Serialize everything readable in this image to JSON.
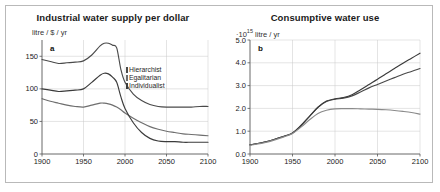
{
  "figure": {
    "panels": [
      "a",
      "b"
    ]
  },
  "panel_a": {
    "letter": "a",
    "title": "Industrial water supply per dollar",
    "unit_prefix": "litre / $ / yr",
    "legend": [
      {
        "label": "Hierarchist",
        "color": "#4a4a4a"
      },
      {
        "label": "Egalitarian",
        "color": "#6e6e6e"
      },
      {
        "label": "Individualist",
        "color": "#3b3b3b"
      }
    ]
  },
  "panel_b": {
    "letter": "b",
    "title": "Consumptive water use",
    "unit_main": "·10",
    "unit_exp": "15",
    "unit_tail": " litre / yr"
  },
  "chart_data": [
    {
      "type": "line",
      "title": "Industrial water supply per dollar",
      "panel": "a",
      "xlabel": "",
      "ylabel": "litre / $ / yr",
      "xlim": [
        1900,
        2100
      ],
      "ylim": [
        0,
        175
      ],
      "xticks": [
        1900,
        1950,
        2000,
        2050,
        2100
      ],
      "yticks": [
        0,
        50,
        100,
        150
      ],
      "grid": true,
      "legend_position": "upper-right",
      "series": [
        {
          "name": "Hierarchist",
          "color": "#4a4a4a",
          "x": [
            1900,
            1910,
            1920,
            1930,
            1940,
            1950,
            1960,
            1970,
            1975,
            1980,
            1985,
            1990,
            1995,
            2000,
            2010,
            2020,
            2030,
            2040,
            2050,
            2060,
            2070,
            2080,
            2090,
            2100
          ],
          "values": [
            145,
            142,
            139,
            140,
            141,
            143,
            152,
            166,
            170,
            170,
            167,
            163,
            130,
            110,
            92,
            82,
            76,
            73,
            72,
            72,
            72,
            72,
            73,
            73
          ]
        },
        {
          "name": "Egalitarian",
          "color": "#6e6e6e",
          "x": [
            1900,
            1910,
            1920,
            1930,
            1940,
            1950,
            1960,
            1970,
            1975,
            1980,
            1985,
            1990,
            1995,
            2000,
            2010,
            2020,
            2030,
            2040,
            2050,
            2060,
            2070,
            2080,
            2090,
            2100
          ],
          "values": [
            85,
            81,
            78,
            75,
            73,
            72,
            75,
            78,
            78,
            77,
            75,
            72,
            68,
            63,
            55,
            48,
            42,
            38,
            35,
            33,
            31,
            30,
            29,
            28
          ]
        },
        {
          "name": "Individualist",
          "color": "#3b3b3b",
          "x": [
            1900,
            1910,
            1920,
            1930,
            1940,
            1950,
            1960,
            1970,
            1975,
            1980,
            1985,
            1990,
            1995,
            2000,
            2010,
            2020,
            2030,
            2040,
            2050,
            2060,
            2070,
            2080,
            2090,
            2100
          ],
          "values": [
            100,
            98,
            96,
            97,
            98,
            100,
            110,
            121,
            124,
            123,
            118,
            110,
            88,
            70,
            48,
            33,
            24,
            20,
            19,
            19,
            18,
            18,
            18,
            18
          ]
        }
      ]
    },
    {
      "type": "line",
      "title": "Consumptive water use",
      "panel": "b",
      "xlabel": "",
      "ylabel": "·10^15 litre / yr",
      "xlim": [
        1900,
        2100
      ],
      "ylim": [
        0.0,
        5.0
      ],
      "xticks": [
        1900,
        1950,
        2000,
        2050,
        2100
      ],
      "yticks": [
        "0.0",
        "1.0",
        "2.0",
        "3.0",
        "4.0",
        "5.0"
      ],
      "grid": true,
      "legend_position": "none",
      "series": [
        {
          "name": "Hierarchist",
          "color": "#4a4a4a",
          "x": [
            1900,
            1920,
            1940,
            1950,
            1960,
            1970,
            1980,
            1990,
            2000,
            2010,
            2020,
            2030,
            2040,
            2050,
            2060,
            2070,
            2080,
            2090,
            2100
          ],
          "values": [
            0.4,
            0.55,
            0.78,
            0.92,
            1.25,
            1.65,
            2.05,
            2.3,
            2.4,
            2.45,
            2.55,
            2.72,
            2.9,
            3.05,
            3.2,
            3.35,
            3.5,
            3.62,
            3.75
          ]
        },
        {
          "name": "Individualist",
          "color": "#3b3b3b",
          "x": [
            1900,
            1920,
            1940,
            1950,
            1960,
            1970,
            1980,
            1990,
            2000,
            2010,
            2020,
            2030,
            2040,
            2050,
            2060,
            2070,
            2080,
            2090,
            2100
          ],
          "values": [
            0.4,
            0.55,
            0.78,
            0.92,
            1.25,
            1.65,
            2.05,
            2.32,
            2.42,
            2.48,
            2.6,
            2.82,
            3.05,
            3.28,
            3.52,
            3.75,
            3.98,
            4.2,
            4.42
          ]
        },
        {
          "name": "Egalitarian",
          "color": "#8a8a8a",
          "x": [
            1900,
            1920,
            1940,
            1950,
            1960,
            1970,
            1980,
            1990,
            2000,
            2010,
            2020,
            2030,
            2040,
            2050,
            2060,
            2070,
            2080,
            2090,
            2100
          ],
          "values": [
            0.38,
            0.52,
            0.75,
            0.9,
            1.18,
            1.5,
            1.78,
            1.92,
            1.98,
            1.99,
            1.99,
            1.98,
            1.97,
            1.96,
            1.94,
            1.91,
            1.87,
            1.82,
            1.75
          ]
        }
      ]
    }
  ]
}
